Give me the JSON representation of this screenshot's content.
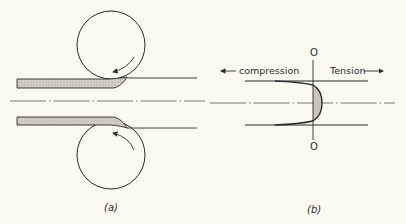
{
  "figure": {
    "panel_a": {
      "caption": "(a)",
      "description": "Strip passing between two rolls, leaving roll gap"
    },
    "panel_b": {
      "caption": "(b)",
      "axis_top_label": "O",
      "axis_bottom_label": "O",
      "left_label": "compression",
      "right_label": "Tension",
      "left_arrow": "←",
      "right_arrow": "→",
      "description": "Residual stress distribution across strip thickness"
    },
    "colors": {
      "background": "#fbfaf0",
      "line": "#2a2a2a",
      "shade": "#c9c6bd"
    }
  }
}
